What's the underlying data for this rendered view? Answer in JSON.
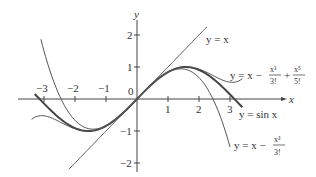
{
  "chart_data": {
    "type": "line",
    "title": "",
    "xlabel": "x",
    "ylabel": "y",
    "xlim": [
      -3.5,
      4.2
    ],
    "ylim": [
      -2.3,
      2.6
    ],
    "grid": false,
    "x_ticks": [
      -3,
      -2,
      -1,
      1,
      2,
      3
    ],
    "x_tick_labels": [
      "−3",
      "−2",
      "−1",
      "1",
      "2",
      "3"
    ],
    "y_ticks": [
      2,
      1,
      -1,
      -2
    ],
    "y_tick_labels": [
      "2",
      "1",
      "−1",
      "−2"
    ],
    "origin_label": "0",
    "series": [
      {
        "name": "y = x",
        "function": "x",
        "x_range": [
          -2.2,
          2.25
        ],
        "style": "thin"
      },
      {
        "name": "y = sin x",
        "function": "sin(x)",
        "x_range": [
          -3.3,
          3.4
        ],
        "style": "thick"
      },
      {
        "name": "y = x − x³/3!",
        "function": "x - x^3/6",
        "x_range": [
          -3.1,
          3.0
        ],
        "style": "thin"
      },
      {
        "name": "y = x − x³/3! + x⁵/5!",
        "function": "x - x^3/6 + x^5/120",
        "x_range": [
          -3.4,
          3.4
        ],
        "style": "thin"
      }
    ],
    "annotations": [
      {
        "text": "y = x",
        "position": "upper right of line"
      },
      {
        "text": "y = x − x³/3! + x⁵/5!",
        "position": "right"
      },
      {
        "text": "y = sin x",
        "position": "near x=3 below axis"
      },
      {
        "text": "y = x − x³/3!",
        "position": "lower right"
      }
    ]
  },
  "labels": {
    "x_axis": "x",
    "y_axis": "y",
    "origin": "0",
    "eq_line": "y = x",
    "eq_sin": "y = sin x",
    "eq_prefix": "y = x −",
    "x3": "x³",
    "f3": "3!",
    "x5": "x⁵",
    "f5": "5!",
    "plus": "+"
  },
  "style": {
    "curve_color": "#555555",
    "sin_color": "#444444",
    "axis_color": "#444444"
  }
}
